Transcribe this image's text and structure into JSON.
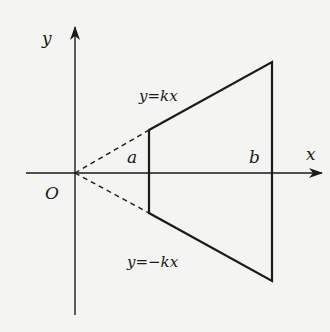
{
  "diagram": {
    "colors": {
      "background": "#f4f4f2",
      "stroke": "#1a1a1a"
    },
    "axes": {
      "x_label": "x",
      "y_label": "y",
      "origin_label": "O"
    },
    "lines": {
      "upper_label": "y=kx",
      "lower_label": "y=−kx"
    },
    "points": {
      "a_label": "a",
      "b_label": "b"
    }
  }
}
